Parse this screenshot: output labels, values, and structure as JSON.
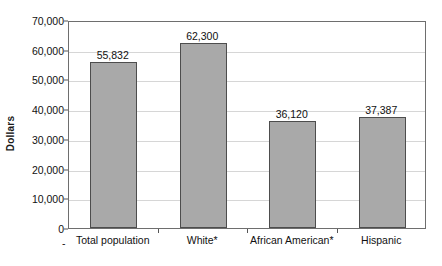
{
  "chart_data": {
    "type": "bar",
    "title": "",
    "subtitle": "",
    "xlabel": "",
    "ylabel": "Dollars",
    "categories": [
      "Total population",
      "White*",
      "African American*",
      "Hispanic"
    ],
    "values": [
      55832,
      62300,
      36120,
      37387
    ],
    "value_labels": [
      "55,832",
      "62,300",
      "36,120",
      "37,387"
    ],
    "ylim": [
      0,
      70000
    ],
    "ytick_values": [
      0,
      10000,
      20000,
      30000,
      40000,
      50000,
      60000,
      70000
    ],
    "ytick_labels": [
      "0",
      "10,000",
      "20,000",
      "30,000",
      "40,000",
      "50,000",
      "60,000",
      "70,000"
    ],
    "grid": true,
    "grid_axis": "y",
    "legend": false,
    "legend_position": "none",
    "bar_fill_color": "#a9a9a9",
    "bar_border_color": "#4d4d4d",
    "gridline_color": "#d6d6d6",
    "plot_border_color": "#6e6e6e",
    "text_color": "#111111",
    "background_color": "#ffffff",
    "annotations": [
      "-"
    ]
  }
}
